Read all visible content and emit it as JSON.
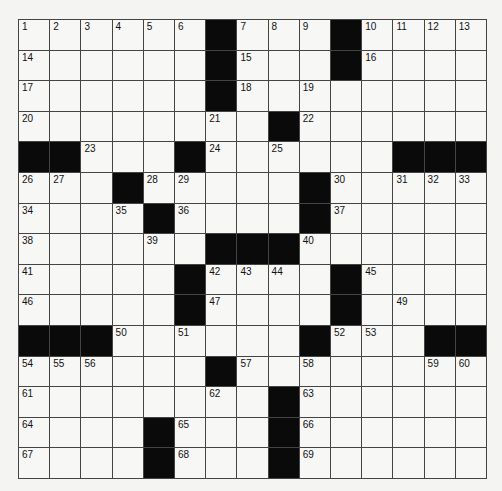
{
  "puzzle": {
    "rows": 15,
    "cols": 15,
    "layout": [
      "......#...#....",
      "......#...#....",
      "......#........",
      "........#......",
      "##...#......###",
      "...#.....#.....",
      "....#....#.....",
      "......###......",
      ".....#....#....",
      ".....#....#....",
      "###......#...##",
      "......#........",
      "........#......",
      "....#...#......",
      "....#...#......"
    ],
    "numbers": [
      [
        1,
        2,
        3,
        4,
        5,
        6,
        0,
        7,
        8,
        9,
        0,
        10,
        11,
        12,
        13
      ],
      [
        14,
        0,
        0,
        0,
        0,
        0,
        0,
        15,
        0,
        0,
        0,
        16,
        0,
        0,
        0
      ],
      [
        17,
        0,
        0,
        0,
        0,
        0,
        0,
        18,
        0,
        19,
        0,
        0,
        0,
        0,
        0
      ],
      [
        20,
        0,
        0,
        0,
        0,
        0,
        21,
        0,
        0,
        22,
        0,
        0,
        0,
        0,
        0
      ],
      [
        0,
        0,
        23,
        0,
        0,
        0,
        24,
        0,
        25,
        0,
        0,
        0,
        0,
        0,
        0
      ],
      [
        26,
        27,
        0,
        0,
        28,
        29,
        0,
        0,
        0,
        0,
        30,
        0,
        31,
        32,
        33
      ],
      [
        34,
        0,
        0,
        35,
        0,
        36,
        0,
        0,
        0,
        0,
        37,
        0,
        0,
        0,
        0
      ],
      [
        38,
        0,
        0,
        0,
        39,
        0,
        0,
        0,
        0,
        40,
        0,
        0,
        0,
        0,
        0
      ],
      [
        41,
        0,
        0,
        0,
        0,
        0,
        42,
        43,
        44,
        0,
        0,
        45,
        0,
        0,
        0
      ],
      [
        46,
        0,
        0,
        0,
        0,
        0,
        47,
        0,
        0,
        0,
        48,
        0,
        49,
        0,
        0
      ],
      [
        0,
        0,
        0,
        50,
        0,
        51,
        0,
        0,
        0,
        0,
        52,
        53,
        0,
        0,
        0
      ],
      [
        54,
        55,
        56,
        0,
        0,
        0,
        0,
        57,
        0,
        58,
        0,
        0,
        0,
        59,
        60
      ],
      [
        61,
        0,
        0,
        0,
        0,
        0,
        62,
        0,
        0,
        63,
        0,
        0,
        0,
        0,
        0
      ],
      [
        64,
        0,
        0,
        0,
        0,
        65,
        0,
        0,
        0,
        66,
        0,
        0,
        0,
        0,
        0
      ],
      [
        67,
        0,
        0,
        0,
        0,
        68,
        0,
        0,
        0,
        69,
        0,
        0,
        0,
        0,
        0
      ]
    ]
  }
}
